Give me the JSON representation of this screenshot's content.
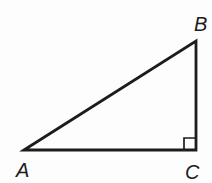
{
  "figure": {
    "type": "right-triangle",
    "background_color": "#fdfdfd",
    "stroke_color": "#1c1c1c",
    "label_color": "#1c1c1c",
    "triangle_stroke_width": 2.8,
    "right_angle_stroke_width": 1.7,
    "vertices": [
      {
        "id": "A",
        "label": "A",
        "x": 24,
        "y": 150,
        "label_x": 16,
        "label_y": 177
      },
      {
        "id": "B",
        "label": "B",
        "x": 196,
        "y": 41,
        "label_x": 194,
        "label_y": 31
      },
      {
        "id": "C",
        "label": "C",
        "x": 196,
        "y": 150,
        "label_x": 185,
        "label_y": 179
      }
    ],
    "right_angle": {
      "at_vertex": "C",
      "size": 12
    }
  }
}
